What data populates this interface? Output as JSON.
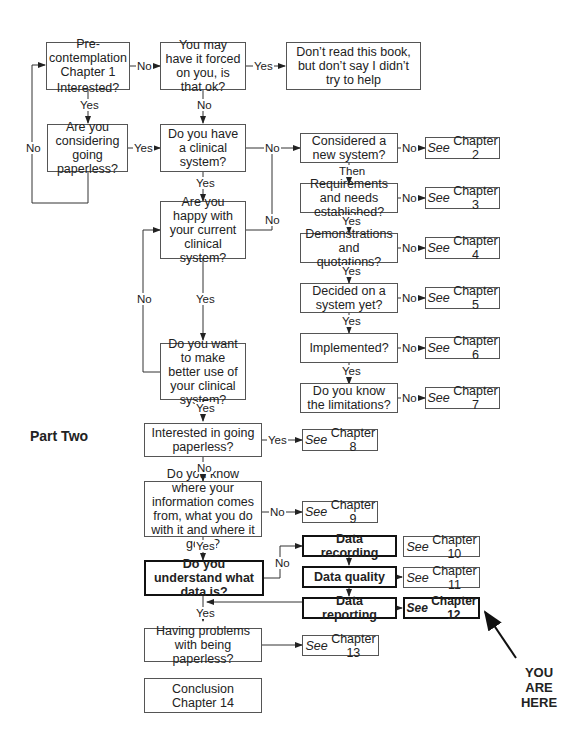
{
  "diagram": {
    "section_label": "Part Two",
    "you_are_here": "YOU ARE HERE",
    "nodes": {
      "precontemplation": {
        "line1": "Pre-contemplation",
        "line2": "Chapter 1",
        "line3": "Interested?"
      },
      "forced": "You may have it forced on you, is that ok?",
      "dont_read": "Don’t read this book, but don’t say I didn’t try to help",
      "considering": "Are you considering going paperless?",
      "have_system": "Do you have a clinical system?",
      "considered_new": "Considered a new system?",
      "requirements": "Requirements and needs established?",
      "demonstrations": "Demonstrations and quotations?",
      "decided": "Decided on a system yet?",
      "implemented": "Implemented?",
      "limitations": "Do you know the limitations?",
      "happy": "Are you happy with your current clinical system?",
      "better_use": "Do you want to make better use of your clinical system?",
      "interested_paperless": "Interested in going paperless?",
      "know_info": "Do you know where your information comes from, what you do with it and where it goes?",
      "understand_data": "Do you understand what data is?",
      "data_recording": "Data recording",
      "data_quality": "Data quality",
      "data_reporting": "Data reporting",
      "problems": "Having problems with being paperless?",
      "conclusion": {
        "line1": "Conclusion",
        "line2": "Chapter 14"
      }
    },
    "chapters": [
      {
        "see": "See",
        "label": "Chapter 2"
      },
      {
        "see": "See",
        "label": "Chapter 3"
      },
      {
        "see": "See",
        "label": "Chapter 4"
      },
      {
        "see": "See",
        "label": "Chapter 5"
      },
      {
        "see": "See",
        "label": "Chapter 6"
      },
      {
        "see": "See",
        "label": "Chapter 7"
      },
      {
        "see": "See",
        "label": "Chapter 8"
      },
      {
        "see": "See",
        "label": "Chapter 9"
      },
      {
        "see": "See",
        "label": "Chapter 10"
      },
      {
        "see": "See",
        "label": "Chapter 11"
      },
      {
        "see": "See",
        "label": "Chapter 12"
      },
      {
        "see": "See",
        "label": "Chapter 13"
      }
    ],
    "edge_labels": {
      "yes": "Yes",
      "no": "No",
      "then": "Then"
    }
  }
}
